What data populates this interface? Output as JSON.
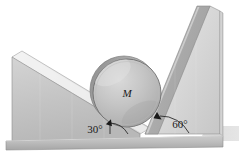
{
  "figure": {
    "type": "mechanics-diagram",
    "background_color": "#ffffff",
    "width": 239,
    "height": 153
  },
  "labels": {
    "mass": "M",
    "left_angle": "30°",
    "right_angle": "60°"
  },
  "colors": {
    "left_wedge_face": "#c6c6c6",
    "left_wedge_top": "#e6e6e6",
    "left_wedge_bevel": "#f2f2f2",
    "right_wedge_face": "#dcdcdc",
    "right_wedge_incline": "#b4b4b4",
    "right_wedge_side": "#d0d0d0",
    "base_band": "#bfbfbf",
    "base_band_shadow": "#a9a9a9",
    "cylinder_body": "#c2c2c2",
    "cylinder_rim": "#9a9a9a",
    "cylinder_highlight": "#d8d8d8",
    "ground_shadow": "#cfcfcf",
    "outline": "#6e6e6e",
    "text": "#1a1a1a"
  },
  "geometry": {
    "left_wedge_angle_deg": 30,
    "right_wedge_angle_deg": 60,
    "cylinder_center": {
      "x": 127,
      "y": 93
    },
    "cylinder_radius": 34
  },
  "annotations": [
    {
      "name": "left-angle-arc",
      "value": "30°",
      "arrow": true
    },
    {
      "name": "right-angle-arc",
      "value": "60°",
      "arrow": true
    }
  ]
}
